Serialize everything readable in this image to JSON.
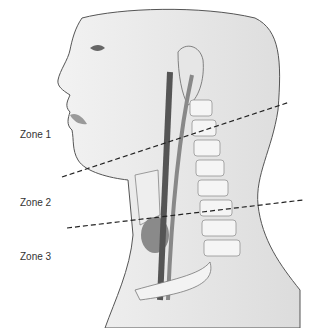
{
  "figure": {
    "labels": [
      {
        "text": "Zone 1",
        "x": 20,
        "y": 129
      },
      {
        "text": "Zone 2",
        "x": 20,
        "y": 197
      },
      {
        "text": "Zone 3",
        "x": 20,
        "y": 251
      }
    ],
    "dashed_lines": [
      {
        "x1": 62,
        "y1": 177,
        "x2": 290,
        "y2": 102
      },
      {
        "x1": 67,
        "y1": 228,
        "x2": 303,
        "y2": 200
      }
    ],
    "colors": {
      "skin": "#ebebeb",
      "outline": "#555555",
      "vessel_dark": "#5a5a5a",
      "vessel_light": "#8a8a8a",
      "bone": "#f4f4f4",
      "dash": "#222222"
    }
  }
}
